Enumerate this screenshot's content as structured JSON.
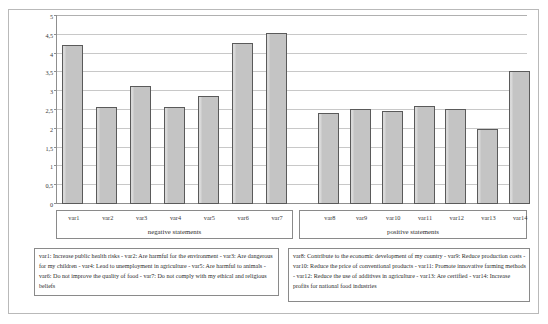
{
  "chart_data": {
    "type": "bar",
    "title": "",
    "subtitle": "",
    "xlabel": "",
    "ylabel": "",
    "ylim": [
      0,
      5
    ],
    "grid": true,
    "legend_position": "below-plot",
    "categories": [
      "var1",
      "var2",
      "var3",
      "var4",
      "var5",
      "var6",
      "var7",
      "var8",
      "var9",
      "var10",
      "var11",
      "var12",
      "var13",
      "var14"
    ],
    "values": [
      4.22,
      2.57,
      3.15,
      2.58,
      2.88,
      4.29,
      4.55,
      2.42,
      2.53,
      2.47,
      2.6,
      2.53,
      2.0,
      3.55
    ],
    "series": [
      {
        "name": "mean score",
        "values": [
          4.22,
          2.57,
          3.15,
          2.58,
          2.88,
          4.29,
          4.55,
          2.42,
          2.53,
          2.47,
          2.6,
          2.53,
          2.0,
          3.55
        ]
      }
    ],
    "groups": [
      {
        "title": "negative statements",
        "categories": [
          "var1",
          "var2",
          "var3",
          "var4",
          "var5",
          "var6",
          "var7"
        ],
        "values": [
          4.22,
          2.57,
          3.15,
          2.58,
          2.88,
          4.29,
          4.55
        ]
      },
      {
        "title": "positive statements",
        "categories": [
          "var8",
          "var9",
          "var10",
          "var11",
          "var12",
          "var13",
          "var14"
        ],
        "values": [
          2.42,
          2.53,
          2.47,
          2.6,
          2.53,
          2.0,
          3.55
        ]
      }
    ],
    "ytick_labels": [
      "0",
      "0,5",
      "1",
      "1,5",
      "2",
      "2,5",
      "3",
      "3,5",
      "4",
      "4,5",
      "5"
    ],
    "ytick_values": [
      0,
      0.5,
      1,
      1.5,
      2,
      2.5,
      3,
      3.5,
      4,
      4.5,
      5
    ],
    "annotations": [
      "var1: Increase public health risks - var2: Are harmful for the environment - var3: Are dangerous for my children - var4: Lead to unemployment in agriculture - var5: Are harmful to animals - var6: Do not improve the quality of food - var7: Do not comply with my ethical and religious beliefs",
      "var8: Contribute to the economic development of my country - var9: Reduce production costs - var10: Reduce the price of conventional products - var11: Promote innovative farming methods - var12: Reduce the use of additives in agriculture - var13: Are certified - var14: Increase profits for national food industries"
    ],
    "colors": {
      "bar_fill": "#c4c4c4",
      "bar_border": "#5a5a5a",
      "gridline": "#c8c8c8",
      "axis": "#8f8f8f",
      "background": "#ffffff"
    }
  },
  "notes": {
    "negative": "var1: Increase public health risks - var2: Are harmful for the environment - var3: Are dangerous for my children - var4: Lead to unemployment in agriculture - var5: Are harmful to animals - var6: Do not improve the quality of food - var7: Do not comply with my ethical and religious beliefs",
    "positive": "var8: Contribute to the economic development of my country - var9: Reduce production costs - var10: Reduce the price of conventional products - var11: Promote innovative farming methods - var12: Reduce the use of additives in agriculture - var13: Are certified - var14: Increase profits for national food industries"
  }
}
